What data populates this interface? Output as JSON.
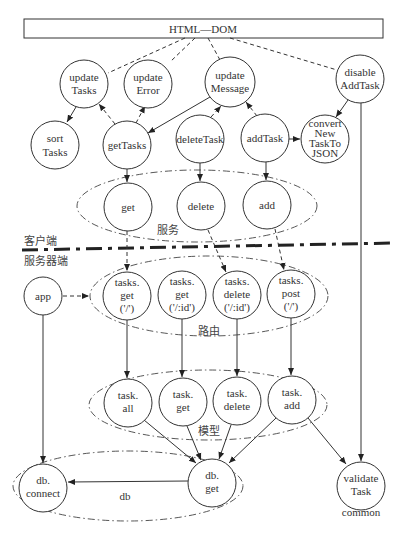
{
  "header": {
    "title": "HTML—DOM"
  },
  "sections": {
    "client_label": "客户端",
    "server_label": "服务器端"
  },
  "groups": {
    "services": "服务",
    "routes": "路由",
    "model": "模型",
    "db": "db",
    "common": "common"
  },
  "nodes": {
    "updateTasks": [
      "update",
      "Tasks"
    ],
    "updateError": [
      "update",
      "Error"
    ],
    "updateMessage": [
      "update",
      "Message"
    ],
    "disableAddTask": [
      "disable",
      "AddTask"
    ],
    "sortTasks": [
      "sort",
      "Tasks"
    ],
    "getTasks": [
      "getTasks"
    ],
    "deleteTask": [
      "deleteTask"
    ],
    "addTask": [
      "addTask"
    ],
    "convertNewTaskToJSON": [
      "convert",
      "New",
      "TaskTo",
      "JSON"
    ],
    "svcGet": [
      "get"
    ],
    "svcDelete": [
      "delete"
    ],
    "svcAdd": [
      "add"
    ],
    "app": [
      "app"
    ],
    "routeGetAll": [
      "tasks.",
      "get",
      "('/')"
    ],
    "routeGetId": [
      "tasks.",
      "get",
      "('/:id')"
    ],
    "routeDeleteId": [
      "tasks.",
      "delete",
      "('/:id')"
    ],
    "routePost": [
      "tasks.",
      "post",
      "('/')"
    ],
    "taskAll": [
      "task.",
      "all"
    ],
    "taskGet": [
      "task.",
      "get"
    ],
    "taskDelete": [
      "task.",
      "delete"
    ],
    "taskAdd": [
      "task.",
      "add"
    ],
    "dbConnect": [
      "db.",
      "connect"
    ],
    "dbGet": [
      "db.",
      "get"
    ],
    "validateTask": [
      "validate",
      "Task"
    ]
  },
  "colors": {
    "stroke": "#333333",
    "background": "#ffffff"
  }
}
